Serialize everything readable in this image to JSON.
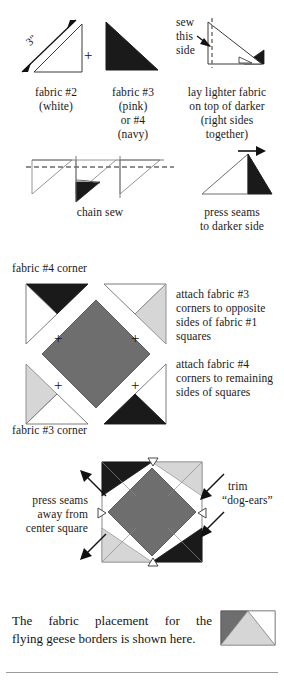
{
  "document": {
    "type": "quilting-instruction-diagram",
    "title": "Half-square triangle and flying geese piecing instructions"
  },
  "colors": {
    "white_fabric": "#ffffff",
    "navy_fabric": "#1a1a1a",
    "pink_fabric": "#d6d6d6",
    "center_gray": "#6e6e6e",
    "outline": "#555555",
    "text": "#161616",
    "rule": "#9a9a9a"
  },
  "step1": {
    "dimension_label": "3\"",
    "plus_symbol": "+",
    "left_caption_line1": "fabric #2",
    "left_caption_line2": "(white)",
    "mid_caption_line1": "fabric #3",
    "mid_caption_line2": "(pink)",
    "mid_caption_line3": "or #4",
    "mid_caption_line4": "(navy)",
    "sew_label_line1": "sew",
    "sew_label_line2": "this",
    "sew_label_line3": "side",
    "right_caption_line1": "lay lighter fabric",
    "right_caption_line2": "on top of darker",
    "right_caption_line3": "(right sides",
    "right_caption_line4": "together)"
  },
  "step2": {
    "chain_sew_caption": "chain sew",
    "press_caption_line1": "press seams",
    "press_caption_line2": "to darker side"
  },
  "step3": {
    "label_top": "fabric #4 corner",
    "label_bottom": "fabric #3 corner",
    "plus_symbol": "+",
    "instruction_a_line1": "attach fabric #3",
    "instruction_a_line2": "corners to opposite",
    "instruction_a_line3": "sides of fabric #1",
    "instruction_a_line4": "squares",
    "instruction_b_line1": "attach fabric #4",
    "instruction_b_line2": "corners to remaining",
    "instruction_b_line3": "sides of squares"
  },
  "step4": {
    "press_line1": "press seams",
    "press_line2": "away from",
    "press_line3": "center square",
    "trim_line1": "trim",
    "trim_line2": "“dog-ears”"
  },
  "footer": {
    "line1": "The fabric placement for the",
    "line2": "flying geese borders is shown here."
  }
}
